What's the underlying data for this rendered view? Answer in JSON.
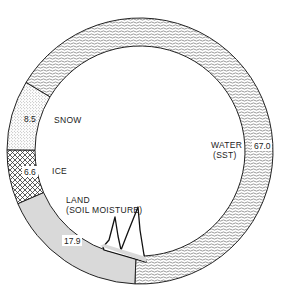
{
  "chart_data": {
    "type": "pie",
    "subtype": "donut",
    "title": "",
    "categories": [
      "WATER (SST)",
      "SNOW",
      "ICE",
      "LAND (SOIL MOISTURE)"
    ],
    "values": [
      67.0,
      8.5,
      6.6,
      17.9
    ],
    "value_labels": [
      "67.0",
      "8.5",
      "6.6",
      "17.9"
    ],
    "patterns": [
      "wavy-lines",
      "stipple",
      "crosshatch",
      "light-gray-fill"
    ],
    "annotations": [
      "Mountain silhouette drawn inside LAND segment"
    ]
  },
  "labels": {
    "water_line1": "WATER",
    "water_line2": "(SST)",
    "water_value": "67.0",
    "snow": "SNOW",
    "snow_value": "8.5",
    "ice": "ICE",
    "ice_value": "6.6",
    "land_line1": "LAND",
    "land_line2": "(SOIL MOISTURE)",
    "land_value": "17.9"
  }
}
